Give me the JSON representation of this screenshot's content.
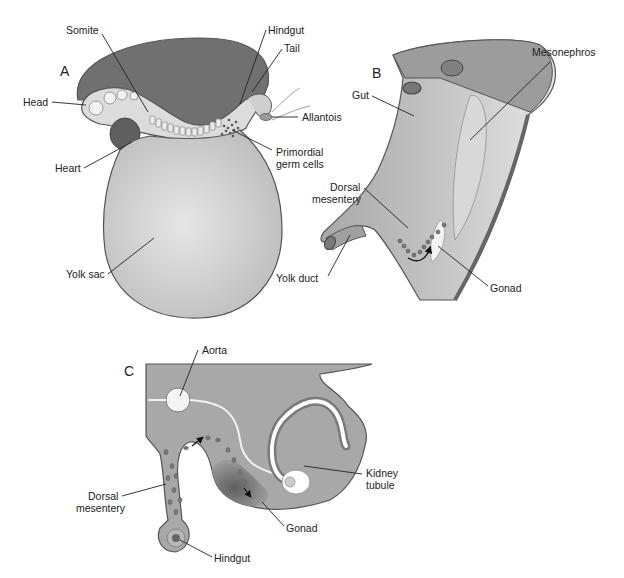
{
  "diagram": {
    "colors": {
      "background": "#ffffff",
      "amnion_dark": "#6e6e6e",
      "tissue_mid": "#a9a9a9",
      "tissue_light": "#cfcfcf",
      "yolk_sac": "#d8d8d8",
      "gonad_dark": "#6a6a6a",
      "outline": "#555555",
      "text": "#222222"
    },
    "panels": [
      {
        "id": "A",
        "letter": "A",
        "labels": {
          "somite": "Somite",
          "hindgut": "Hindgut",
          "tail": "Tail",
          "head": "Head",
          "allantois": "Allantois",
          "heart": "Heart",
          "primordial_germ_cells_1": "Primordial",
          "primordial_germ_cells_2": "germ cells",
          "yolk_sac": "Yolk sac"
        }
      },
      {
        "id": "B",
        "letter": "B",
        "labels": {
          "mesonephros": "Mesonephros",
          "gut": "Gut",
          "dorsal_mesentery_1": "Dorsal",
          "dorsal_mesentery_2": "mesentery",
          "yolk_duct": "Yolk duct",
          "gonad": "Gonad"
        }
      },
      {
        "id": "C",
        "letter": "C",
        "labels": {
          "aorta": "Aorta",
          "kidney_tubule_1": "Kidney",
          "kidney_tubule_2": "tubule",
          "dorsal_mesentery_1": "Dorsal",
          "dorsal_mesentery_2": "mesentery",
          "gonad": "Gonad",
          "hindgut": "Hindgut"
        }
      }
    ]
  }
}
